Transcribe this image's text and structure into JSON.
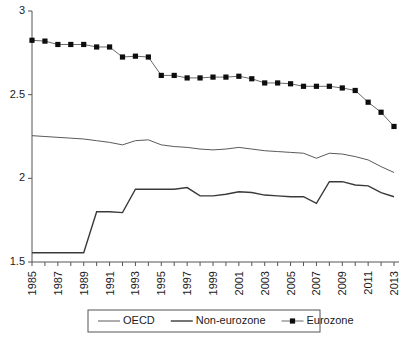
{
  "chart_data": {
    "type": "line",
    "title": "",
    "subtitle": "",
    "xlabel": "",
    "ylabel": "",
    "grid": false,
    "legend_position": "bottom",
    "ylim": [
      1.5,
      3.0
    ],
    "yticks": [
      "1.5",
      "2",
      "2.5",
      "3"
    ],
    "ytick_values": [
      1.5,
      2.0,
      2.5,
      3.0
    ],
    "xlim": [
      1985,
      2013
    ],
    "x": [
      1985,
      1986,
      1987,
      1988,
      1989,
      1990,
      1991,
      1992,
      1993,
      1994,
      1995,
      1996,
      1997,
      1998,
      1999,
      2000,
      2001,
      2002,
      2003,
      2004,
      2005,
      2006,
      2007,
      2008,
      2009,
      2010,
      2011,
      2012,
      2013
    ],
    "xtick_labels": [
      "1985",
      "",
      "1987",
      "",
      "1989",
      "",
      "1991",
      "",
      "1993",
      "",
      "1995",
      "",
      "1997",
      "",
      "1999",
      "",
      "2001",
      "",
      "2003",
      "",
      "2005",
      "",
      "2007",
      "",
      "2009",
      "",
      "2011",
      "",
      "2013"
    ],
    "xtick_labels_shown": [
      "1985",
      "1987",
      "1989",
      "1991",
      "1993",
      "1995",
      "1997",
      "1999",
      "2001",
      "2003",
      "2005",
      "2007",
      "2009",
      "2011",
      "2013"
    ],
    "series": [
      {
        "name": "OECD",
        "marker": "none",
        "color": "#5a5a5a",
        "values": [
          2.255,
          2.25,
          2.245,
          2.24,
          2.235,
          2.225,
          2.215,
          2.2,
          2.225,
          2.23,
          2.2,
          2.19,
          2.185,
          2.175,
          2.17,
          2.175,
          2.185,
          2.175,
          2.165,
          2.16,
          2.155,
          2.15,
          2.12,
          2.15,
          2.145,
          2.13,
          2.11,
          2.07,
          2.035
        ]
      },
      {
        "name": "Non-eurozone",
        "marker": "none",
        "color": "#3a3a3a",
        "values": [
          1.555,
          1.555,
          1.555,
          1.555,
          1.555,
          1.8,
          1.8,
          1.795,
          1.935,
          1.935,
          1.935,
          1.935,
          1.945,
          1.895,
          1.895,
          1.905,
          1.92,
          1.915,
          1.9,
          1.895,
          1.89,
          1.89,
          1.85,
          1.98,
          1.98,
          1.96,
          1.955,
          1.915,
          1.89
        ]
      },
      {
        "name": "Eurozone",
        "marker": "square",
        "color": "#0d0d0d",
        "values": [
          2.825,
          2.82,
          2.8,
          2.8,
          2.8,
          2.785,
          2.785,
          2.725,
          2.73,
          2.725,
          2.615,
          2.615,
          2.6,
          2.6,
          2.605,
          2.605,
          2.61,
          2.595,
          2.57,
          2.57,
          2.565,
          2.55,
          2.55,
          2.55,
          2.54,
          2.525,
          2.455,
          2.395,
          2.31
        ]
      }
    ]
  },
  "legend": {
    "items": [
      {
        "label": "OECD",
        "style": "thin-line"
      },
      {
        "label": "Non-eurozone",
        "style": "thick-line"
      },
      {
        "label": "Eurozone",
        "style": "line-with-square-marker"
      }
    ]
  }
}
